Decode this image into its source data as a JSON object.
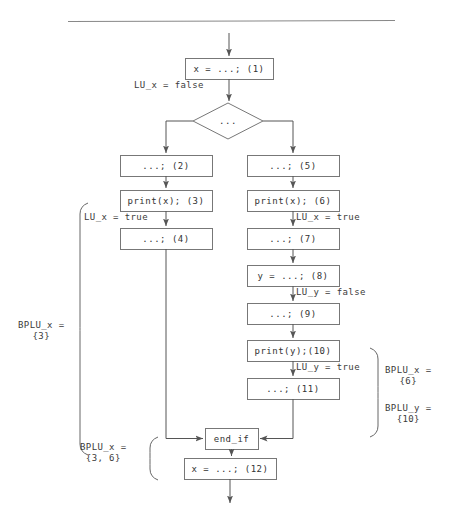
{
  "figure": {
    "type": "flowchart"
  },
  "rule": {
    "name": "top-horizontal-rule"
  },
  "nodes": [
    {
      "id": "n1",
      "label": "x = ...; (1)",
      "shape": "rect",
      "x": 185,
      "y": 58,
      "w": 88,
      "h": 21
    },
    {
      "id": "n2",
      "label": "...",
      "shape": "diamond",
      "x": 193,
      "y": 103,
      "w": 70,
      "h": 36
    },
    {
      "id": "n3",
      "label": "...; (2)",
      "shape": "rect",
      "x": 120,
      "y": 155,
      "w": 92,
      "h": 21
    },
    {
      "id": "n4",
      "label": "...; (5)",
      "shape": "rect",
      "x": 247,
      "y": 155,
      "w": 92,
      "h": 21
    },
    {
      "id": "n5",
      "label": "print(x); (3)",
      "shape": "rect",
      "x": 120,
      "y": 190,
      "w": 92,
      "h": 21
    },
    {
      "id": "n6",
      "label": "print(x); (6)",
      "shape": "rect",
      "x": 247,
      "y": 190,
      "w": 92,
      "h": 21
    },
    {
      "id": "n7",
      "label": "...; (4)",
      "shape": "rect",
      "x": 120,
      "y": 228,
      "w": 92,
      "h": 21
    },
    {
      "id": "n8",
      "label": "...; (7)",
      "shape": "rect",
      "x": 247,
      "y": 228,
      "w": 92,
      "h": 21
    },
    {
      "id": "n9",
      "label": "y = ...; (8)",
      "shape": "rect",
      "x": 247,
      "y": 265,
      "w": 92,
      "h": 21
    },
    {
      "id": "n10",
      "label": "...; (9)",
      "shape": "rect",
      "x": 247,
      "y": 303,
      "w": 92,
      "h": 21
    },
    {
      "id": "n11",
      "label": "print(y);(10)",
      "shape": "rect",
      "x": 247,
      "y": 340,
      "w": 92,
      "h": 21
    },
    {
      "id": "n12",
      "label": "...; (11)",
      "shape": "rect",
      "x": 247,
      "y": 378,
      "w": 92,
      "h": 21
    },
    {
      "id": "n13",
      "label": "end_if",
      "shape": "rect",
      "x": 205,
      "y": 428,
      "w": 53,
      "h": 21
    },
    {
      "id": "n14",
      "label": "x = ...; (12)",
      "shape": "rect",
      "x": 184,
      "y": 458,
      "w": 92,
      "h": 21
    }
  ],
  "edge_labels": [
    {
      "id": "e1",
      "text": "LU_x = false",
      "x": 134,
      "y": 80,
      "name": "edge-label-lu-x-false-1"
    },
    {
      "id": "e2",
      "text": "LU_x = true",
      "x": 84,
      "y": 212,
      "name": "edge-label-lu-x-true-left"
    },
    {
      "id": "e3",
      "text": "LU_x = true",
      "x": 296,
      "y": 212,
      "name": "edge-label-lu-x-true-right"
    },
    {
      "id": "e4",
      "text": "LU_y = false",
      "x": 296,
      "y": 287,
      "name": "edge-label-lu-y-false"
    },
    {
      "id": "e5",
      "text": "LU_y = true",
      "x": 296,
      "y": 362,
      "name": "edge-label-lu-y-true"
    }
  ],
  "annotations": [
    {
      "id": "a1",
      "line1": "BPLU_x =",
      "line2": "{3}",
      "x": 18,
      "y": 320,
      "name": "annotation-bplu-x-3"
    },
    {
      "id": "a2",
      "line1": "BPLU_x =",
      "line2": "{3, 6}",
      "x": 80,
      "y": 442,
      "name": "annotation-bplu-x-3-6"
    },
    {
      "id": "a3",
      "line1": "BPLU_x =",
      "line2": "{6}",
      "x": 385,
      "y": 365,
      "name": "annotation-bplu-x-6"
    },
    {
      "id": "a4",
      "line1": "BPLU_y =",
      "line2": "{10}",
      "x": 385,
      "y": 403,
      "name": "annotation-bplu-y-10"
    }
  ],
  "braces": [
    {
      "id": "b1",
      "name": "brace-left-tall",
      "x": 80,
      "y1": 203,
      "y2": 455,
      "dir": "left"
    },
    {
      "id": "b2",
      "name": "brace-left-small",
      "x": 150,
      "y1": 437,
      "y2": 480,
      "dir": "left"
    },
    {
      "id": "b3",
      "name": "brace-right",
      "x": 378,
      "y1": 348,
      "y2": 437,
      "dir": "right"
    }
  ],
  "style": {
    "stroke": "#555555",
    "box_stroke": "#777777",
    "text": "#333333",
    "background": "#ffffff"
  }
}
